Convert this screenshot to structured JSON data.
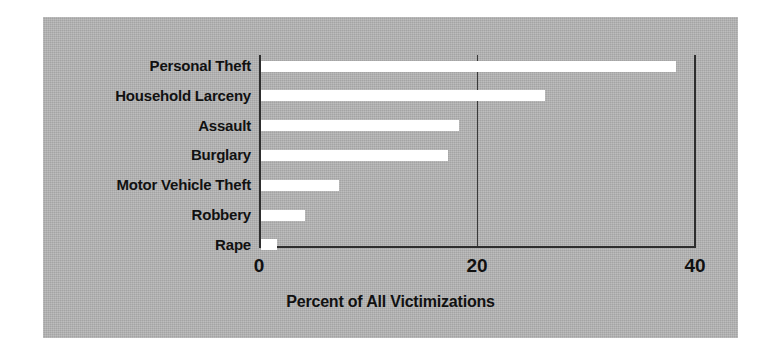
{
  "chart_data": {
    "type": "bar",
    "orientation": "horizontal",
    "title": "",
    "xlabel": "Percent of All Victimizations",
    "ylabel": "",
    "categories": [
      "Personal Theft",
      "Household Larceny",
      "Assault",
      "Burglary",
      "Motor Vehicle Theft",
      "Robbery",
      "Rape"
    ],
    "values": [
      38.1,
      26.1,
      18.2,
      17.2,
      7.2,
      4.0,
      1.5
    ],
    "xlim": [
      0,
      40
    ],
    "xticks": [
      0,
      20,
      40
    ],
    "xtick_labels": [
      "0",
      "20",
      "40"
    ],
    "grid": "vertical-at-20",
    "legend": "none",
    "series": [
      {
        "name": "Percent of All Victimizations",
        "values": [
          38.1,
          26.1,
          18.2,
          17.2,
          7.2,
          4.0,
          1.5
        ]
      }
    ]
  },
  "style": {
    "panel_background": "#b5b5b5",
    "figure_background": "#ffffff",
    "bar_color": "#ffffff",
    "axis_color": "#2e2e2e",
    "text_color": "#111111"
  }
}
